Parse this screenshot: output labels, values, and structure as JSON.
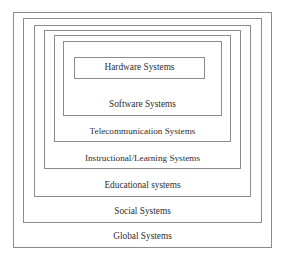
{
  "diagram": {
    "type": "nested-hierarchy",
    "title": "",
    "shape": "concentric-rectangles",
    "ordering": "outermost-to-innermost",
    "border_color": "#8b8b8b",
    "background_color": "#ffffff",
    "text_color": "#2e2e2e",
    "layer_count": 7,
    "layers": [
      {
        "level": 1,
        "name": "global-systems",
        "label": "Global Systems"
      },
      {
        "level": 2,
        "name": "social-systems",
        "label": "Social Systems"
      },
      {
        "level": 3,
        "name": "educational-systems",
        "label": "Educational systems"
      },
      {
        "level": 4,
        "name": "instructional-learning-systems",
        "label": "Instructional/Learning Systems"
      },
      {
        "level": 5,
        "name": "telecommunication-systems",
        "label": "Telecommunication Systems"
      },
      {
        "level": 6,
        "name": "software-systems",
        "label": "Software Systems"
      },
      {
        "level": 7,
        "name": "hardware-systems",
        "label": "Hardware Systems"
      }
    ]
  }
}
